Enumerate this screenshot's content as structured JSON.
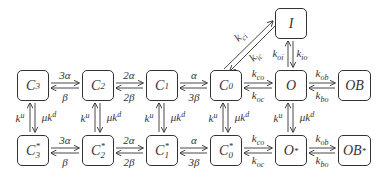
{
  "diagram": {
    "type": "state-transition",
    "nodes": {
      "C3": {
        "label": "C",
        "sub": "3",
        "sup": ""
      },
      "C2": {
        "label": "C",
        "sub": "2",
        "sup": ""
      },
      "C1": {
        "label": "C",
        "sub": "1",
        "sup": ""
      },
      "C0": {
        "label": "C",
        "sub": "0",
        "sup": ""
      },
      "O": {
        "label": "O",
        "sub": "",
        "sup": ""
      },
      "OB": {
        "label": "OB",
        "sub": "",
        "sup": ""
      },
      "I": {
        "label": "I",
        "sub": "",
        "sup": ""
      },
      "C3s": {
        "label": "C",
        "sub": "3",
        "sup": "*"
      },
      "C2s": {
        "label": "C",
        "sub": "2",
        "sup": "*"
      },
      "C1s": {
        "label": "C",
        "sub": "1",
        "sup": "*"
      },
      "C0s": {
        "label": "C",
        "sub": "0",
        "sup": "*"
      },
      "Os": {
        "label": "O",
        "sub": "",
        "sup": "*"
      },
      "OBs": {
        "label": "OB",
        "sub": "",
        "sup": " *"
      }
    },
    "rates": {
      "c3_c2_fwd": "3α",
      "c3_c2_back": "β",
      "c2_c1_fwd": "2α",
      "c2_c1_back": "2β",
      "c1_c0_fwd": "α",
      "c1_c0_back": "3β",
      "c0_o_fwd": {
        "base": "k",
        "sub": "co"
      },
      "c0_o_back": {
        "base": "k",
        "sub": "oc"
      },
      "o_ob_fwd": {
        "base": "k",
        "sub": "ob"
      },
      "o_ob_back": {
        "base": "k",
        "sub": "bo"
      },
      "c0_i": {
        "base": "k",
        "sub": "ci"
      },
      "i_c0": {
        "base": "k",
        "sub": "ic"
      },
      "o_i": {
        "base": "k",
        "sub": "oi"
      },
      "i_o": {
        "base": "k",
        "sub": "io"
      },
      "vertical_up": {
        "base": "k",
        "sup": "u"
      },
      "vertical_down": {
        "prefix": "μk",
        "sup": "d"
      }
    }
  }
}
